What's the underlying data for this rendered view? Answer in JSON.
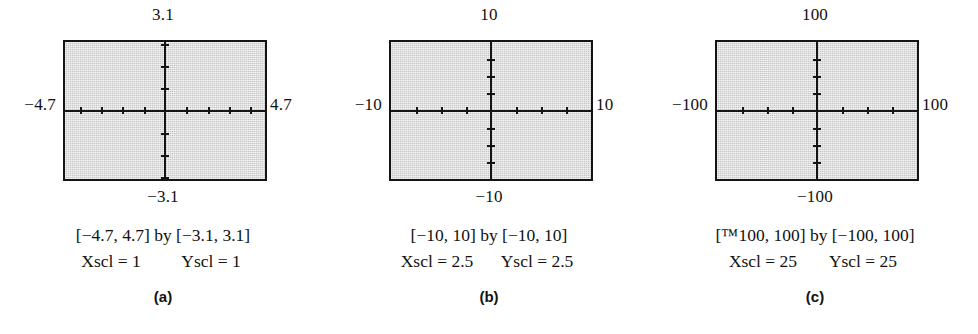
{
  "figure": {
    "type": "graphing-calculator-viewing-windows",
    "panels": [
      {
        "tag": "(a)",
        "top_label": "3.1",
        "bottom_label": "−3.1",
        "left_label": "−4.7",
        "right_label": "4.7",
        "caption_range": "[−4.7, 4.7] by [−3.1, 3.1]",
        "xscl_label": "Xscl = 1",
        "yscl_label": "Yscl = 1",
        "ticks_x_per_side": 4,
        "ticks_y_per_side": 3
      },
      {
        "tag": "(b)",
        "top_label": "10",
        "bottom_label": "−10",
        "left_label": "−10",
        "right_label": "10",
        "caption_range": "[−10, 10] by [−10, 10]",
        "xscl_label": "Xscl = 2.5",
        "yscl_label": "Yscl = 2.5",
        "ticks_x_per_side": 3,
        "ticks_y_per_side": 3
      },
      {
        "tag": "(c)",
        "top_label": "100",
        "bottom_label": "−100",
        "left_label": "−100",
        "right_label": "100",
        "caption_range": "[™100, 100] by [−100, 100]",
        "xscl_label": "Xscl = 25",
        "yscl_label": "Yscl = 25",
        "ticks_x_per_side": 3,
        "ticks_y_per_side": 3
      }
    ],
    "colors": {
      "screen_fill": "#c6c6c6",
      "ink": "#141414",
      "page_background": "#ffffff"
    }
  },
  "chart_data": {
    "type": "scatter",
    "title": "",
    "plots": [
      {
        "name": "(a)",
        "xlim": [
          -4.7,
          4.7
        ],
        "ylim": [
          -3.1,
          3.1
        ],
        "xscl": 1,
        "yscl": 1,
        "x_ticks": [
          -4,
          -3,
          -2,
          -1,
          1,
          2,
          3,
          4
        ],
        "y_ticks": [
          -3,
          -2,
          -1,
          1,
          2,
          3
        ],
        "grid": false,
        "series": []
      },
      {
        "name": "(b)",
        "xlim": [
          -10,
          10
        ],
        "ylim": [
          -10,
          10
        ],
        "xscl": 2.5,
        "yscl": 2.5,
        "x_ticks": [
          -7.5,
          -5,
          -2.5,
          2.5,
          5,
          7.5
        ],
        "y_ticks": [
          -7.5,
          -5,
          -2.5,
          2.5,
          5,
          7.5
        ],
        "grid": false,
        "series": []
      },
      {
        "name": "(c)",
        "xlim": [
          -100,
          100
        ],
        "ylim": [
          -100,
          100
        ],
        "xscl": 25,
        "yscl": 25,
        "x_ticks": [
          -75,
          -50,
          -25,
          25,
          50,
          75
        ],
        "y_ticks": [
          -75,
          -50,
          -25,
          25,
          50,
          75
        ],
        "grid": false,
        "series": []
      }
    ]
  }
}
